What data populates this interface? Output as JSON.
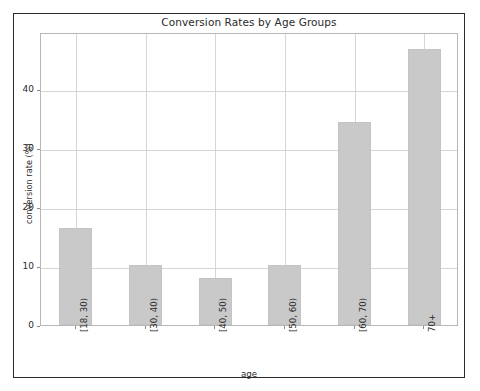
{
  "chart_data": {
    "type": "bar",
    "title": "Conversion Rates by Age Groups",
    "xlabel": "age",
    "ylabel": "conversion rate (%)",
    "categories": [
      "[18, 30)",
      "[30, 40)",
      "[40, 50)",
      "[50, 60)",
      "[60, 70)",
      "70+"
    ],
    "values": [
      16.4,
      10.1,
      7.9,
      10.2,
      34.5,
      46.9
    ],
    "yticks": [
      0,
      10,
      20,
      30,
      40
    ],
    "ylim": [
      0,
      49.8
    ],
    "grid": true,
    "legend": null,
    "bar_color": "#c9c9c9",
    "background_color": "#ffffff",
    "text_color": "#2b2b2b",
    "grid_color": "#d6d6d6"
  }
}
